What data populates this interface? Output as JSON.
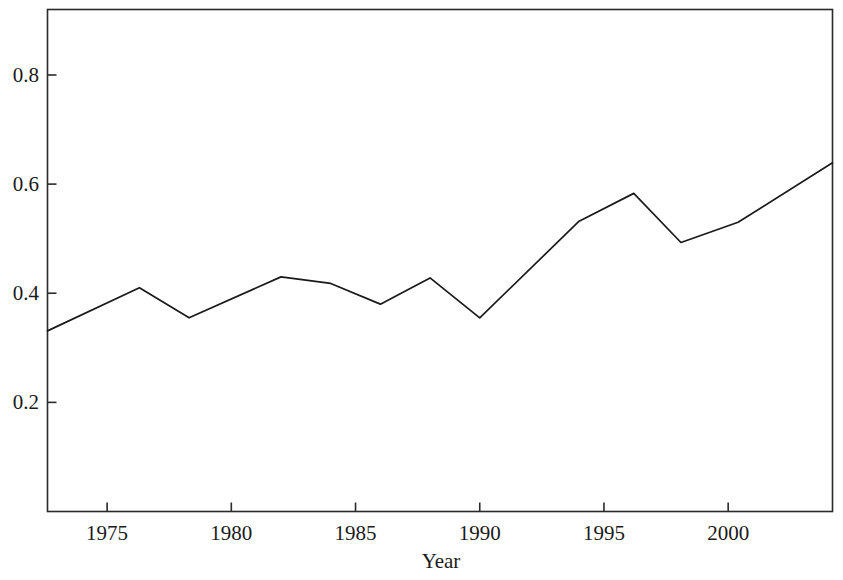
{
  "chart_data": {
    "type": "line",
    "title": "",
    "subtitle": "",
    "xlabel": "Year",
    "ylabel": "",
    "xlim": [
      1972.6,
      2004.2
    ],
    "ylim": [
      0.0,
      0.92
    ],
    "grid": false,
    "legend": null,
    "xticks": [
      1975,
      1980,
      1985,
      1990,
      1995,
      2000
    ],
    "xtick_labels": [
      "1975",
      "1980",
      "1985",
      "1990",
      "1995",
      "2000"
    ],
    "yticks": [
      0.2,
      0.4,
      0.6,
      0.8
    ],
    "ytick_labels": [
      "0.2",
      "0.4",
      "0.6",
      "0.8"
    ],
    "series": [
      {
        "name": "value",
        "color": "#1a1a1a",
        "x": [
          1972.6,
          1976.3,
          1978.3,
          1982.0,
          1984.0,
          1986.0,
          1988.0,
          1990.0,
          1994.0,
          1996.2,
          1998.1,
          2000.4,
          2004.2
        ],
        "values": [
          0.331,
          0.41,
          0.355,
          0.43,
          0.418,
          0.38,
          0.428,
          0.355,
          0.532,
          0.583,
          0.493,
          0.53,
          0.639
        ]
      }
    ]
  },
  "axes": {
    "x_axis_title": "Year"
  }
}
